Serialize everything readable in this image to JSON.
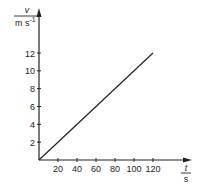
{
  "chart_data": {
    "type": "line",
    "title": "",
    "xlabel": "t",
    "xunit": "s",
    "ylabel": "v",
    "yunit": "m s-1",
    "xlim": [
      0,
      130
    ],
    "ylim": [
      0,
      13
    ],
    "grid": false,
    "legend": null,
    "x_ticks": [
      20,
      40,
      60,
      80,
      100,
      120
    ],
    "y_ticks": [
      2,
      4,
      6,
      8,
      10,
      12
    ],
    "series": [
      {
        "name": "v(t)",
        "x": [
          0,
          120
        ],
        "y": [
          0,
          12
        ]
      }
    ]
  },
  "axes": {
    "y_label_symbol": "v",
    "y_label_unit_base": "m s",
    "y_label_unit_exp": "-1",
    "x_label_symbol": "t",
    "x_label_unit": "s",
    "x_tick_labels": [
      "20",
      "40",
      "60",
      "80",
      "100",
      "120"
    ],
    "y_tick_labels": [
      "2",
      "4",
      "6",
      "8",
      "10",
      "12"
    ]
  },
  "colors": {
    "axis": "#222222",
    "line": "#222222"
  }
}
